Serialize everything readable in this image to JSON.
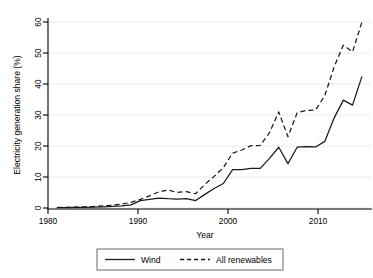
{
  "chart_data": {
    "type": "line",
    "title": "",
    "xlabel": "Year",
    "ylabel": "Electricity generation share (%)",
    "xlim": [
      1980,
      2015
    ],
    "ylim": [
      0,
      62
    ],
    "xticks": [
      1980,
      1990,
      2000,
      2010
    ],
    "yticks": [
      0,
      10,
      20,
      30,
      40,
      50,
      60
    ],
    "grid": "horizontal",
    "legend_position": "below-axes",
    "x": [
      1981,
      1982,
      1983,
      1984,
      1985,
      1986,
      1987,
      1988,
      1989,
      1990,
      1991,
      1992,
      1993,
      1994,
      1995,
      1996,
      1997,
      1998,
      1999,
      2000,
      2001,
      2002,
      2003,
      2004,
      2005,
      2006,
      2007,
      2008,
      2009,
      2010,
      2011,
      2012,
      2013,
      2014
    ],
    "series": [
      {
        "name": "Wind",
        "style": "solid",
        "color": "#1a1a1a",
        "values": [
          0.1,
          0.1,
          0.2,
          0.2,
          0.3,
          0.4,
          0.5,
          0.7,
          1.0,
          2.4,
          2.8,
          3.2,
          3.0,
          2.9,
          3.0,
          2.4,
          4.4,
          6.3,
          7.9,
          12.4,
          12.4,
          12.8,
          12.8,
          16.0,
          19.6,
          14.3,
          19.6,
          19.8,
          19.7,
          21.5,
          29.0,
          34.8,
          33.2,
          42.3
        ]
      },
      {
        "name": "All renewables",
        "style": "dashed",
        "color": "#1a1a1a",
        "values": [
          0.2,
          0.2,
          0.3,
          0.4,
          0.5,
          0.7,
          0.9,
          1.3,
          1.8,
          2.8,
          3.9,
          5.2,
          5.8,
          5.0,
          5.3,
          4.6,
          7.6,
          10.2,
          13.0,
          17.7,
          18.7,
          20.1,
          20.2,
          24.3,
          31.0,
          23.0,
          30.7,
          31.5,
          31.6,
          36.3,
          45.5,
          52.5,
          50.4,
          59.8
        ]
      }
    ],
    "legend": [
      {
        "label": "Wind",
        "style": "solid"
      },
      {
        "label": "All renewables",
        "style": "dashed"
      }
    ]
  }
}
